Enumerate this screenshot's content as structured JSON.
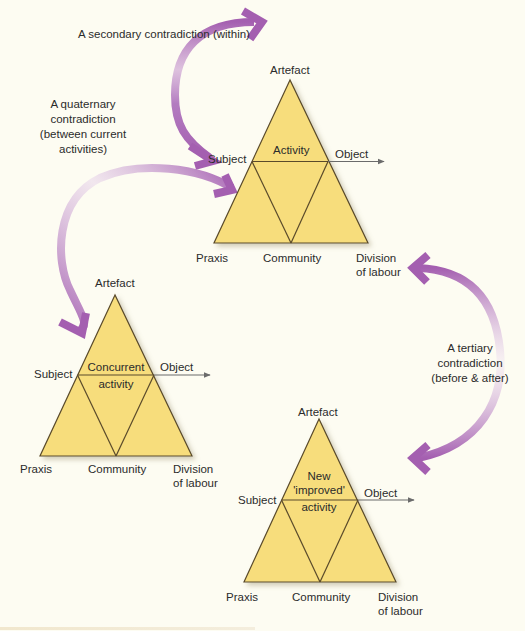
{
  "diagram": {
    "type": "activity-system-contradictions",
    "colors": {
      "background": "#fdfcf2",
      "triangle_fill": "#f7dd7c",
      "triangle_stroke": "#5a4a2a",
      "arrow": "#a45fb0",
      "text": "#2b2b2b"
    },
    "annotations": {
      "secondary": "A secondary contradiction (within)",
      "quaternary": [
        "A quaternary",
        "contradiction",
        "(between current",
        "activities)"
      ],
      "tertiary": [
        "A tertiary",
        "contradiction",
        "(before & after)"
      ]
    },
    "triangles": [
      {
        "id": "central-activity",
        "artefact": "Artefact",
        "subject": "Subject",
        "object": "Object",
        "praxis": "Praxis",
        "community": "Community",
        "division": [
          "Division",
          "of labour"
        ],
        "center_label": [
          "Activity"
        ]
      },
      {
        "id": "concurrent-activity",
        "artefact": "Artefact",
        "subject": "Subject",
        "object": "Object",
        "praxis": "Praxis",
        "community": "Community",
        "division": [
          "Division",
          "of labour"
        ],
        "center_label": [
          "Concurrent",
          "activity"
        ]
      },
      {
        "id": "new-activity",
        "artefact": "Artefact",
        "subject": "Subject",
        "object": "Object",
        "praxis": "Praxis",
        "community": "Community",
        "division": [
          "Division",
          "of labour"
        ],
        "center_label": [
          "New",
          "'improved'",
          "activity"
        ]
      }
    ],
    "arrows": [
      {
        "name": "secondary-contradiction-arrow",
        "from": "annotation-top",
        "to": "central-activity-subject"
      },
      {
        "name": "quaternary-contradiction-arrow",
        "from": "central-activity",
        "to": "concurrent-activity"
      },
      {
        "name": "tertiary-contradiction-arrow",
        "from": "central-activity-division",
        "to": "new-activity"
      }
    ]
  }
}
